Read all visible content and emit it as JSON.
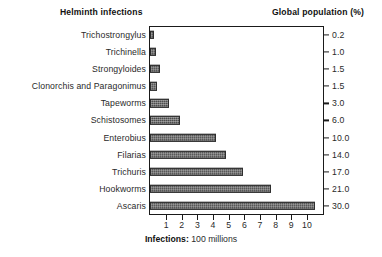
{
  "headers": {
    "left": "Helminth infections",
    "right": "Global population (%)"
  },
  "xaxis": {
    "title_bold": "Infections:",
    "title_rest": " 100 millions",
    "min": 0,
    "max": 11,
    "ticks": [
      1,
      2,
      3,
      4,
      5,
      6,
      7,
      8,
      9,
      10
    ]
  },
  "chart_data": {
    "type": "bar",
    "orientation": "horizontal",
    "title": "",
    "xlabel": "Infections: 100 millions",
    "ylabel": "Helminth infections",
    "xlim": [
      0,
      11
    ],
    "grid": false,
    "legend": null,
    "categories": [
      "Trichostrongylus",
      "Trichinella",
      "Strongyloides",
      "Clonorchis and Paragonimus",
      "Tapeworms",
      "Schistosomes",
      "Enterobius",
      "Filarias",
      "Trichuris",
      "Hookworms",
      "Ascaris"
    ],
    "values": [
      0.2,
      0.35,
      0.6,
      0.45,
      1.2,
      1.9,
      4.2,
      4.8,
      5.9,
      7.7,
      10.5
    ],
    "secondary_axis": {
      "label": "Global population (%)",
      "values": [
        "0.2",
        "1.0",
        "1.5",
        "1.5",
        "3.0",
        "6.0",
        "10.0",
        "14.0",
        "17.0",
        "21.0",
        "30.0"
      ]
    }
  },
  "colors": {
    "bar": "#4d4d4d",
    "axis": "#1a1a1a",
    "text": "#2a2a2a"
  }
}
